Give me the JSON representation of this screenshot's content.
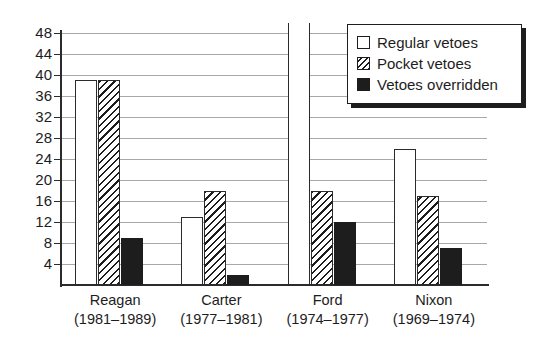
{
  "chart_data": {
    "type": "bar",
    "title": "",
    "xlabel": "",
    "ylabel": "",
    "ylim": [
      0,
      48
    ],
    "ytick_labels": [
      "48",
      "44",
      "40",
      "36",
      "32",
      "28",
      "24",
      "20",
      "16",
      "12",
      "8",
      "4"
    ],
    "ytick_values": [
      48,
      44,
      40,
      36,
      32,
      28,
      24,
      20,
      16,
      12,
      8,
      4
    ],
    "grid": true,
    "legend_position": "top-right",
    "categories": [
      "Reagan",
      "Carter",
      "Ford",
      "Nixon"
    ],
    "category_sublabels": [
      "(1981–1989)",
      "(1977–1981)",
      "(1974–1977)",
      "(1969–1974)"
    ],
    "series": [
      {
        "name": "Regular vetoes",
        "fill": "white",
        "values": [
          39,
          13,
          48,
          26
        ],
        "notes": [
          "",
          "",
          "bar extends beyond top of axis",
          ""
        ]
      },
      {
        "name": "Pocket vetoes",
        "fill": "diagonal-hatch",
        "values": [
          39,
          18,
          18,
          17
        ],
        "notes": [
          "",
          "",
          "",
          ""
        ]
      },
      {
        "name": "Vetoes overridden",
        "fill": "solid-black",
        "values": [
          9,
          2,
          12,
          7
        ],
        "notes": [
          "",
          "",
          "",
          ""
        ]
      }
    ]
  },
  "legend": {
    "items": [
      {
        "label": "Regular vetoes",
        "swatch": "white-square-icon"
      },
      {
        "label": "Pocket vetoes",
        "swatch": "hatched-square-icon"
      },
      {
        "label": "Vetoes overridden",
        "swatch": "black-square-icon"
      }
    ]
  },
  "colors": {
    "ink": "#1d1d1d",
    "gridline": "#a8a8a8",
    "background": "#ffffff"
  }
}
